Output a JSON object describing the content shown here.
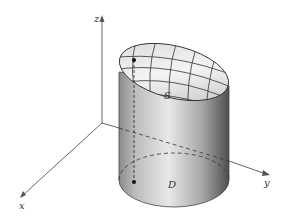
{
  "diagram": {
    "axes": {
      "x_label": "x",
      "y_label": "y",
      "z_label": "z"
    },
    "labels": {
      "surface": "S",
      "region": "D"
    },
    "colors": {
      "axis": "#555555",
      "cylinder_light": "#e6e6e6",
      "cylinder_dark": "#555555",
      "surface_light": "#f2f2f2",
      "surface_dark": "#9a9a9a",
      "grid": "#333333",
      "dot": "#111111"
    }
  }
}
